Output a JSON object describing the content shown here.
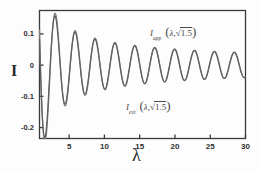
{
  "chart_data": {
    "type": "line",
    "title": "",
    "xlabel": "λ",
    "ylabel": "I",
    "xlim": [
      0.8,
      30
    ],
    "ylim": [
      -0.235,
      0.175
    ],
    "grid": false,
    "legend_position": "inside",
    "xticks": [
      5,
      10,
      15,
      20,
      25,
      30
    ],
    "yticks": [
      0.1,
      0,
      -0.1,
      -0.2
    ],
    "ytick_labels": [
      "0.1",
      "0",
      "-0.1",
      "-0.2"
    ],
    "xtick_labels": [
      "5",
      "10",
      "15",
      "20",
      "25",
      "30"
    ],
    "series": [
      {
        "name": "I_app",
        "legend_main": "I",
        "legend_sub": "app",
        "legend_args": "λ, √1.5",
        "color": "#7d7d7d",
        "description": "Approximate intensity, damped oscillation, slightly larger amplitude near origin",
        "model": "amplitude_decay_A0_over_sqrt_lambda_times_sin",
        "params": {
          "A": 0.33,
          "decay_power": 0.62,
          "period": 2.82,
          "phase": 1.05,
          "offset": 0.0
        }
      },
      {
        "name": "I_exact",
        "legend_main": "I",
        "legend_sub": "ext",
        "legend_args": "λ, √1.5",
        "color": "#606060",
        "description": "Exact intensity, damped oscillation nearly overlapping approximate curve",
        "model": "amplitude_decay_A0_over_sqrt_lambda_times_sin",
        "params": {
          "A": 0.305,
          "decay_power": 0.6,
          "period": 2.82,
          "phase": 1.12,
          "offset": 0.0
        }
      }
    ],
    "annotations": [
      {
        "text": "I_app (λ, √1.5)",
        "x": 19.5,
        "y": 0.125
      },
      {
        "text": "I_ext (λ, √1.5)",
        "x": 15.5,
        "y": -0.105
      }
    ]
  },
  "legend": {
    "app": {
      "symbol": "I",
      "subscript": "app",
      "open_paren": "(",
      "lambda": "λ",
      "comma": ",",
      "radical": "√",
      "radicand": "1.5",
      "close_paren": ")"
    },
    "ext": {
      "symbol": "I",
      "subscript": "ext",
      "open_paren": "(",
      "lambda": "λ",
      "comma": ",",
      "radical": "√",
      "radicand": "1.5",
      "close_paren": ")"
    }
  },
  "axes": {
    "y_label": "I",
    "x_label": "λ",
    "frame_color": "#3a3a3a",
    "y_ticks": [
      {
        "label": "0.1",
        "value": 0.1
      },
      {
        "label": "0",
        "value": 0
      },
      {
        "label": "-0.1",
        "value": -0.1
      },
      {
        "label": "-0.2",
        "value": -0.2
      }
    ],
    "x_ticks": [
      {
        "label": "5",
        "value": 5
      },
      {
        "label": "10",
        "value": 10
      },
      {
        "label": "15",
        "value": 15
      },
      {
        "label": "20",
        "value": 20
      },
      {
        "label": "25",
        "value": 25
      },
      {
        "label": "30",
        "value": 30
      }
    ]
  }
}
